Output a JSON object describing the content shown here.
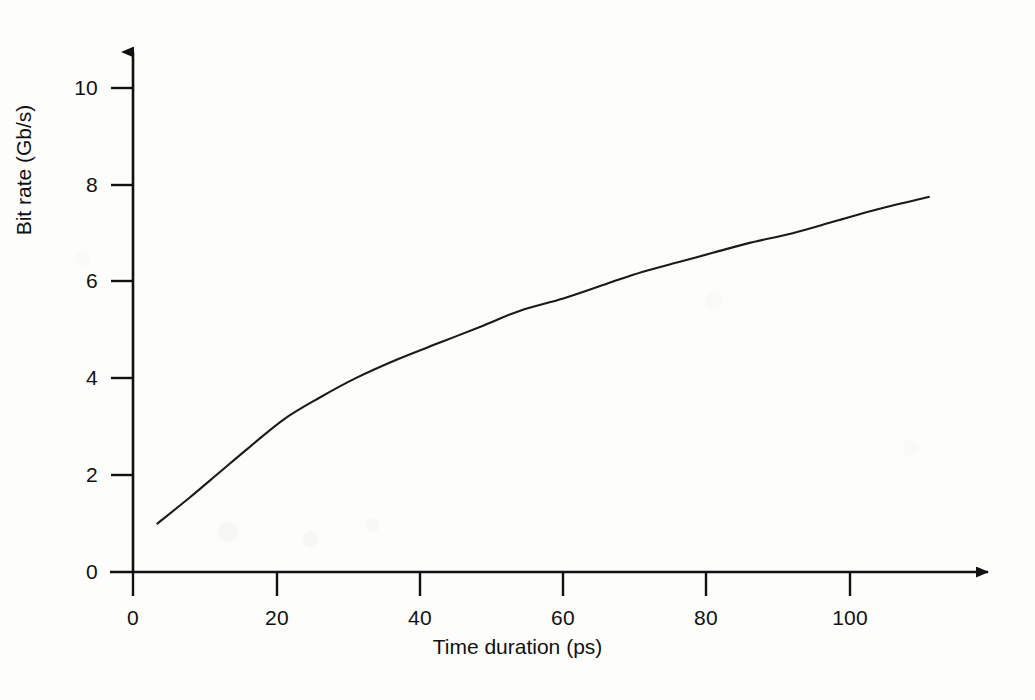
{
  "chart_data": {
    "type": "line",
    "title": "",
    "subtitle": "",
    "xlabel": "Time duration (ps)",
    "ylabel": "Bit rate (Gb/s)",
    "xlim": [
      0,
      115
    ],
    "ylim": [
      0,
      10.8
    ],
    "xticks": [
      0,
      20,
      40,
      60,
      80,
      100
    ],
    "xtick_labels": [
      "0",
      "20",
      "40",
      "60",
      "80",
      "100"
    ],
    "yticks": [
      0,
      2,
      4,
      6,
      8,
      10
    ],
    "ytick_labels": [
      "0",
      "2",
      "4",
      "6",
      "8",
      "10"
    ],
    "grid": false,
    "legend": null,
    "axis_style": "arrow-terminated",
    "line_color": "#1a1a1a",
    "background_color": "#fdfdfb",
    "series": [
      {
        "name": "Bit rate vs time duration",
        "x": [
          3.4,
          8,
          12,
          16,
          21,
          26,
          31,
          37,
          43,
          49,
          54,
          60,
          66,
          71,
          76,
          81,
          86,
          92,
          98,
          104,
          111
        ],
        "y": [
          1.0,
          1.55,
          2.05,
          2.55,
          3.15,
          3.6,
          4.0,
          4.4,
          4.75,
          5.1,
          5.4,
          5.65,
          5.95,
          6.2,
          6.4,
          6.6,
          6.8,
          7.0,
          7.25,
          7.5,
          7.75
        ]
      }
    ],
    "annotations": []
  },
  "axes": {
    "x_arrow": "arrow-right-icon",
    "y_arrow": "arrow-up-icon"
  }
}
